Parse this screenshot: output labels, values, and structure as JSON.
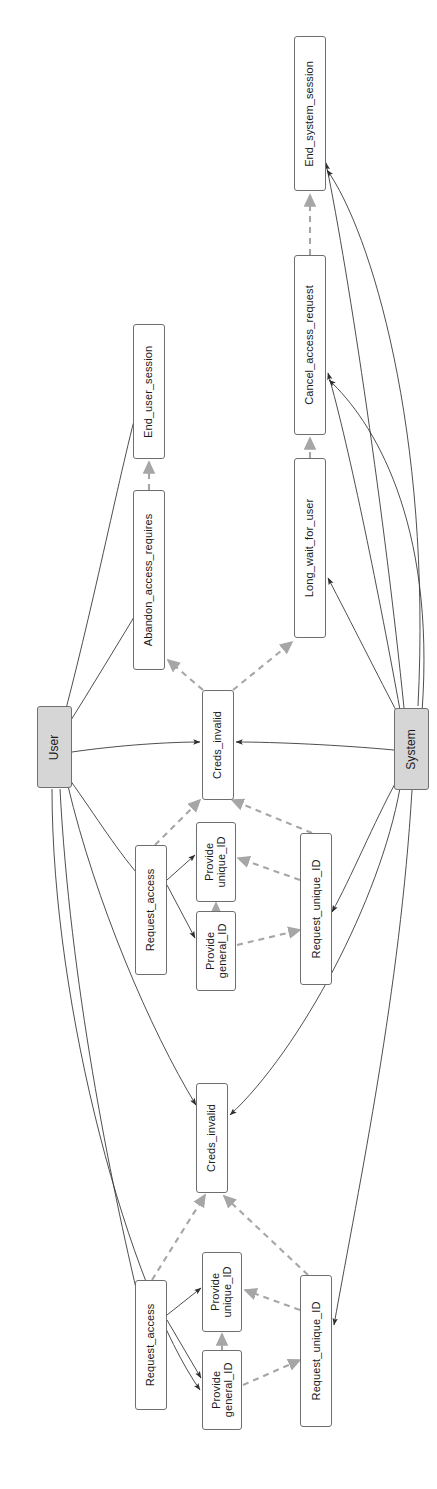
{
  "diagram": {
    "orientation": "rotated-90-ccw",
    "style": {
      "solid_edge_color": "#3a3a3a",
      "dashed_edge_color": "#a6a6a6",
      "actor_fill": "#d6d6d6",
      "node_fill": "#ffffff",
      "node_border": "#6e6e6e",
      "text_color": "#1a1a1a",
      "background": "#ffffff"
    },
    "nodes": [
      {
        "id": "end_system_session",
        "label": "End_system_session",
        "type": "action",
        "x": 294,
        "y": 36,
        "w": 32,
        "h": 155
      },
      {
        "id": "cancel_access_request",
        "label": "Cancel_access_request",
        "type": "action",
        "x": 294,
        "y": 255,
        "w": 32,
        "h": 180
      },
      {
        "id": "end_user_session",
        "label": "End_user_session",
        "type": "action",
        "x": 133,
        "y": 324,
        "w": 32,
        "h": 135
      },
      {
        "id": "long_wait_for_user",
        "label": "Long_wait_for_user",
        "type": "action",
        "x": 294,
        "y": 458,
        "w": 32,
        "h": 180
      },
      {
        "id": "abandon_access_requires",
        "label": "Abandon_access_requires",
        "type": "action",
        "x": 133,
        "y": 490,
        "w": 32,
        "h": 180
      },
      {
        "id": "user",
        "label": "User",
        "type": "actor",
        "x": 37,
        "y": 706,
        "w": 35,
        "h": 82
      },
      {
        "id": "system",
        "label": "System",
        "type": "actor",
        "x": 394,
        "y": 708,
        "w": 35,
        "h": 82
      },
      {
        "id": "creds_invalid_1",
        "label": "Creds_invalid",
        "type": "state",
        "x": 202,
        "y": 690,
        "w": 32,
        "h": 110
      },
      {
        "id": "provide_unique_id_1",
        "label": "Provide\nunique_ID",
        "type": "action",
        "x": 196,
        "y": 822,
        "w": 40,
        "h": 80
      },
      {
        "id": "request_access_1",
        "label": "Request_access",
        "type": "action",
        "x": 135,
        "y": 845,
        "w": 32,
        "h": 130
      },
      {
        "id": "request_unique_id_1",
        "label": "Request_unique_ID",
        "type": "action",
        "x": 300,
        "y": 833,
        "w": 32,
        "h": 152
      },
      {
        "id": "provide_general_id_1",
        "label": "Provide\ngeneral_ID",
        "type": "action",
        "x": 196,
        "y": 911,
        "w": 40,
        "h": 80
      },
      {
        "id": "creds_invalid_2",
        "label": "Creds_invalid",
        "type": "state",
        "x": 196,
        "y": 1083,
        "w": 32,
        "h": 110
      },
      {
        "id": "provide_unique_id_2",
        "label": "Provide\nunique_ID",
        "type": "action",
        "x": 202,
        "y": 1252,
        "w": 40,
        "h": 80
      },
      {
        "id": "request_access_2",
        "label": "Request_access",
        "type": "action",
        "x": 135,
        "y": 1280,
        "w": 32,
        "h": 130
      },
      {
        "id": "request_unique_id_2",
        "label": "Request_unique_ID",
        "type": "action",
        "x": 300,
        "y": 1275,
        "w": 32,
        "h": 152
      },
      {
        "id": "provide_general_id_2",
        "label": "Provide\ngeneral_ID",
        "type": "action",
        "x": 202,
        "y": 1350,
        "w": 40,
        "h": 80
      }
    ],
    "edges": [
      {
        "from": "user",
        "to": "end_user_session",
        "style": "solid",
        "d": "M 62,724 C 95,600 120,470 140,398"
      },
      {
        "from": "user",
        "to": "abandon_access_requires",
        "style": "solid",
        "d": "M 66,728 C 90,690 120,640 142,604"
      },
      {
        "from": "user",
        "to": "creds_invalid_1",
        "style": "solid",
        "d": "M 72,752 C 120,745 170,742 200,742"
      },
      {
        "from": "user",
        "to": "request_access_1",
        "style": "solid",
        "d": "M 70,780 C 95,815 120,855 143,880"
      },
      {
        "from": "user",
        "to": "creds_invalid_2",
        "style": "solid",
        "d": "M 68,786 C 95,900 150,1030 196,1105"
      },
      {
        "from": "user",
        "to": "request_access_2",
        "style": "solid",
        "d": "M 60,789 C 70,980 110,1180 140,1305"
      },
      {
        "from": "user",
        "to": "provide_general_id_2",
        "style": "solid",
        "d": "M 52,789 C 52,1010 130,1290 200,1390"
      },
      {
        "from": "system",
        "to": "end_system_session",
        "style": "solid",
        "d": "M 404,708 C 385,520 350,280 326,163"
      },
      {
        "from": "system",
        "to": "cancel_access_request",
        "style": "solid",
        "d": "M 400,710 C 380,600 350,450 328,373"
      },
      {
        "from": "system",
        "to": "long_wait_for_user",
        "style": "solid",
        "d": "M 398,714 C 380,680 350,620 328,578"
      },
      {
        "from": "system",
        "to": "creds_invalid_1",
        "style": "solid",
        "d": "M 394,750 C 340,745 275,742 236,742"
      },
      {
        "from": "system",
        "to": "request_unique_id_1",
        "style": "solid",
        "d": "M 396,782 C 375,820 350,880 332,912"
      },
      {
        "from": "system",
        "to": "creds_invalid_2",
        "style": "solid",
        "d": "M 400,788 C 380,900 300,1050 230,1115"
      },
      {
        "from": "system",
        "to": "request_unique_id_2",
        "style": "solid",
        "d": "M 412,790 C 400,990 360,1180 334,1325"
      },
      {
        "from": "system",
        "to": "end_system_session",
        "style": "solid",
        "d": "M 418,706 C 432,430 370,230 327,170"
      },
      {
        "from": "system",
        "to": "cancel_access_request",
        "style": "solid",
        "d": "M 422,712 C 436,520 372,420 329,380"
      },
      {
        "from": "creds_invalid_1",
        "to": "abandon_access_requires",
        "style": "dashed",
        "d": "M 203,690 L 168,660"
      },
      {
        "from": "creds_invalid_1",
        "to": "long_wait_for_user",
        "style": "dashed",
        "d": "M 233,690 L 292,642"
      },
      {
        "from": "abandon_access_requires",
        "to": "end_user_session",
        "style": "dashed",
        "d": "M 149,490 L 149,462"
      },
      {
        "from": "long_wait_for_user",
        "to": "cancel_access_request",
        "style": "dashed",
        "d": "M 310,458 L 310,438"
      },
      {
        "from": "cancel_access_request",
        "to": "end_system_session",
        "style": "dashed",
        "d": "M 310,255 L 310,195"
      },
      {
        "from": "request_access_1",
        "to": "creds_invalid_1",
        "style": "dashed",
        "d": "M 155,845 L 200,800"
      },
      {
        "from": "request_unique_id_1",
        "to": "creds_invalid_1",
        "style": "dashed",
        "d": "M 312,833 L 232,800"
      },
      {
        "from": "provide_general_id_1",
        "to": "provide_unique_id_1",
        "style": "dashed",
        "d": "M 216,911 L 216,903"
      },
      {
        "from": "request_unique_id_1",
        "to": "provide_unique_id_1",
        "style": "dashed",
        "d": "M 300,880 L 238,858"
      },
      {
        "from": "provide_general_id_1",
        "to": "request_unique_id_1",
        "style": "dashed",
        "d": "M 237,945 L 300,930"
      },
      {
        "from": "request_access_1",
        "to": "provide_unique_id_1",
        "style": "solid",
        "d": "M 167,880 L 195,855"
      },
      {
        "from": "request_access_1",
        "to": "provide_general_id_1",
        "style": "solid",
        "d": "M 167,885 L 195,938"
      },
      {
        "from": "request_access_2",
        "to": "creds_invalid_2",
        "style": "dashed",
        "d": "M 152,1280 L 205,1195"
      },
      {
        "from": "request_unique_id_2",
        "to": "creds_invalid_2",
        "style": "dashed",
        "d": "M 308,1275 L 224,1196"
      },
      {
        "from": "provide_general_id_2",
        "to": "provide_unique_id_2",
        "style": "dashed",
        "d": "M 222,1350 L 222,1334"
      },
      {
        "from": "request_unique_id_2",
        "to": "provide_unique_id_2",
        "style": "dashed",
        "d": "M 300,1310 L 245,1290"
      },
      {
        "from": "provide_general_id_2",
        "to": "request_unique_id_2",
        "style": "dashed",
        "d": "M 243,1385 L 300,1360"
      },
      {
        "from": "request_access_2",
        "to": "provide_unique_id_2",
        "style": "solid",
        "d": "M 167,1315 L 201,1288"
      },
      {
        "from": "request_access_2",
        "to": "provide_general_id_2",
        "style": "solid",
        "d": "M 167,1320 L 201,1378"
      }
    ]
  }
}
